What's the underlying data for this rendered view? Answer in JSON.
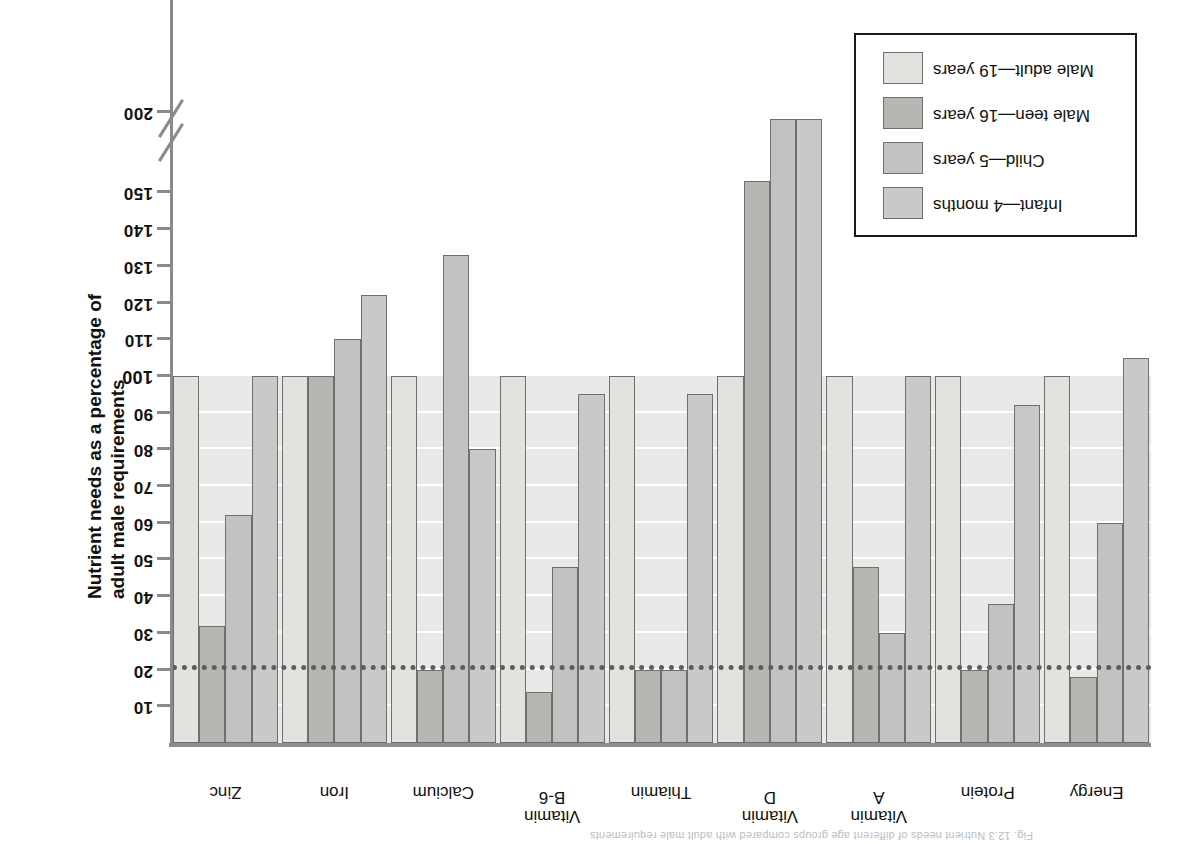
{
  "figure": {
    "caption_fragment": "Fig. 12.3 Nutrient needs of different age groups compared with adult male requirements",
    "orientation_note": "rotated-180"
  },
  "axis": {
    "y_label": "Nutrient needs as a percentage of adult male requirements",
    "tick_labels": [
      "10",
      "20",
      "30",
      "40",
      "50",
      "60",
      "70",
      "80",
      "90",
      "100",
      "110",
      "120",
      "130",
      "140",
      "150",
      "200"
    ],
    "major_tick": "100",
    "has_axis_break": true,
    "break_between": [
      "150",
      "200"
    ],
    "reference_line_value": "20"
  },
  "legend": {
    "items": [
      {
        "label": "Infant—4 months",
        "color": "#c9c9c7"
      },
      {
        "label": "Child—5 years",
        "color": "#c2c2c0"
      },
      {
        "label": "Male teen—16 years",
        "color": "#b6b6b3"
      },
      {
        "label": "Male adult—19 years",
        "color": "#e2e2de"
      }
    ]
  },
  "chart_data": {
    "type": "bar",
    "title": "",
    "xlabel": "",
    "ylabel": "Nutrient needs as a percentage of adult male requirements",
    "ylim": [
      0,
      200
    ],
    "grid": true,
    "legend_position": "bottom-left",
    "reference_line": 20,
    "axis_break": [
      155,
      195
    ],
    "categories": [
      "Energy",
      "Protein",
      "Vitamin\nA",
      "Vitamin\nD",
      "Thiamin",
      "Vitamin\nB-6",
      "Calcium",
      "Iron",
      "Zinc"
    ],
    "series": [
      {
        "name": "Infant—4 months",
        "color": "#c9c9c7",
        "values": [
          105,
          92,
          100,
          198,
          95,
          95,
          80,
          122,
          100
        ]
      },
      {
        "name": "Child—5 years",
        "color": "#c2c2c0",
        "values": [
          60,
          38,
          30,
          198,
          20,
          48,
          133,
          110,
          62
        ]
      },
      {
        "name": "Male teen—16 years",
        "color": "#b6b6b3",
        "values": [
          18,
          20,
          48,
          153,
          20,
          14,
          20,
          100,
          32
        ]
      },
      {
        "name": "Male adult—19 years",
        "color": "#e2e2de",
        "values": [
          100,
          100,
          100,
          100,
          100,
          100,
          100,
          100,
          100
        ]
      }
    ]
  }
}
